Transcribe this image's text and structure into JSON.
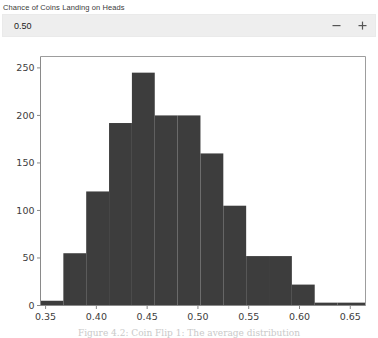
{
  "widget": {
    "label": "Chance of Coins Landing on Heads",
    "value": "0.50",
    "placeholder": "0.50",
    "decrement_label": "−",
    "increment_label": "+",
    "decrement_icon": "minus-icon",
    "increment_icon": "plus-icon"
  },
  "caption": {
    "text": "Figure 4.2: Coin Flip 1: The average distribution"
  },
  "colors": {
    "bar": "#3d3d3d",
    "plot_background": "#ffffff",
    "axis": "#8a8a8a",
    "header_background": "#eeeeee",
    "tick_text": "#3c3c3c"
  },
  "chart_data": {
    "type": "bar",
    "subtype": "histogram",
    "title": "",
    "xlabel": "",
    "ylabel": "",
    "xlim": [
      0.345,
      0.665
    ],
    "ylim": [
      0,
      262
    ],
    "grid": false,
    "legend": false,
    "bin_width": 0.0225,
    "xticks": [
      "0.35",
      "0.40",
      "0.45",
      "0.50",
      "0.55",
      "0.60",
      "0.65"
    ],
    "xtick_values": [
      0.35,
      0.4,
      0.45,
      0.5,
      0.55,
      0.6,
      0.65
    ],
    "yticks": [
      "0",
      "50",
      "100",
      "150",
      "200",
      "250"
    ],
    "ytick_values": [
      0,
      50,
      100,
      150,
      200,
      250
    ],
    "bins": [
      {
        "left": 0.345,
        "right": 0.3675,
        "value": 5
      },
      {
        "left": 0.3675,
        "right": 0.39,
        "value": 55
      },
      {
        "left": 0.39,
        "right": 0.4125,
        "value": 120
      },
      {
        "left": 0.4125,
        "right": 0.435,
        "value": 192
      },
      {
        "left": 0.435,
        "right": 0.4575,
        "value": 245
      },
      {
        "left": 0.4575,
        "right": 0.48,
        "value": 200
      },
      {
        "left": 0.48,
        "right": 0.5025,
        "value": 200
      },
      {
        "left": 0.5025,
        "right": 0.525,
        "value": 160
      },
      {
        "left": 0.525,
        "right": 0.5475,
        "value": 105
      },
      {
        "left": 0.5475,
        "right": 0.57,
        "value": 52
      },
      {
        "left": 0.57,
        "right": 0.5925,
        "value": 52
      },
      {
        "left": 0.5925,
        "right": 0.615,
        "value": 22
      },
      {
        "left": 0.615,
        "right": 0.6375,
        "value": 3
      },
      {
        "left": 0.6375,
        "right": 0.665,
        "value": 3
      }
    ]
  }
}
